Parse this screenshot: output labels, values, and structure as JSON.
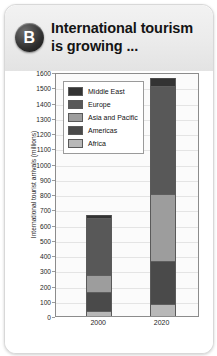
{
  "header": {
    "badge": "B",
    "title_line1": "International tourism",
    "title_line2": "is growing ..."
  },
  "chart_data": {
    "type": "bar",
    "stacked": true,
    "title": "International tourism is growing ...",
    "xlabel": "",
    "ylabel": "International tourist arrivals (millions)",
    "ylim": [
      0,
      1600
    ],
    "ytick_step": 100,
    "yticks": [
      0,
      100,
      200,
      300,
      400,
      500,
      600,
      700,
      800,
      900,
      1000,
      1100,
      1200,
      1300,
      1400,
      1500,
      1600
    ],
    "categories": [
      "2000",
      "2020"
    ],
    "grid": true,
    "legend_position": "upper-left-inside",
    "series": [
      {
        "name": "Africa",
        "color": "#b8b8b8",
        "values": [
          30,
          80
        ]
      },
      {
        "name": "Americas",
        "color": "#4a4a4a",
        "values": [
          130,
          280
        ]
      },
      {
        "name": "Asia and Pacific",
        "color": "#9d9d9d",
        "values": [
          110,
          440
        ]
      },
      {
        "name": "Europe",
        "color": "#585858",
        "values": [
          370,
          710
        ]
      },
      {
        "name": "Middle East",
        "color": "#333333",
        "values": [
          25,
          50
        ]
      }
    ],
    "totals": [
      665,
      1560
    ],
    "stack_order_bottom_to_top": [
      "Africa",
      "Americas",
      "Asia and Pacific",
      "Europe",
      "Middle East"
    ]
  },
  "legend": {
    "items": [
      {
        "label": "Middle East",
        "color": "#333333"
      },
      {
        "label": "Europe",
        "color": "#585858"
      },
      {
        "label": "Asia and Pacific",
        "color": "#9d9d9d"
      },
      {
        "label": "Americas",
        "color": "#4a4a4a"
      },
      {
        "label": "Africa",
        "color": "#b8b8b8"
      }
    ]
  }
}
